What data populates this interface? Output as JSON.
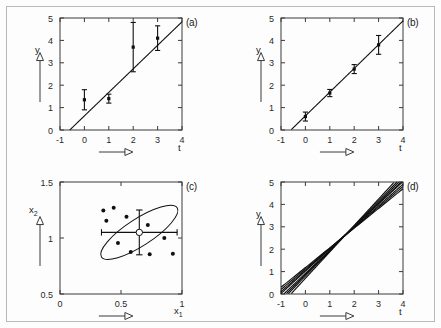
{
  "figure": {
    "panel_labels": [
      "(a)",
      "(b)",
      "(c)",
      "(d)"
    ]
  },
  "chart_data": [
    {
      "panel": "(a)",
      "type": "scatter",
      "title": "",
      "xlabel": "t",
      "ylabel": "y",
      "xlim": [
        -1,
        4
      ],
      "ylim": [
        0,
        5
      ],
      "xticks": [
        -1,
        0,
        1,
        2,
        3,
        4
      ],
      "yticks": [
        0,
        1,
        2,
        3,
        4,
        5
      ],
      "xticklabels": [
        "-1",
        "0",
        "1",
        "2",
        "3",
        "4"
      ],
      "yticklabels": [
        "0",
        "1",
        "2",
        "3",
        "4",
        "5"
      ],
      "grid": false,
      "legend": "none",
      "x": [
        0,
        1,
        2,
        3
      ],
      "values": [
        1.35,
        1.4,
        3.7,
        4.1
      ],
      "yerr": [
        0.45,
        0.2,
        1.1,
        0.55
      ],
      "fit_line": {
        "slope": 1.05,
        "intercept": 0.63,
        "x_start": -0.6,
        "x_end": 4.0
      }
    },
    {
      "panel": "(b)",
      "type": "scatter",
      "title": "",
      "xlabel": "t",
      "ylabel": "y",
      "xlim": [
        -1,
        4
      ],
      "ylim": [
        0,
        5
      ],
      "xticks": [
        -1,
        0,
        1,
        2,
        3,
        4
      ],
      "yticks": [
        0,
        1,
        2,
        3,
        4,
        5
      ],
      "xticklabels": [
        "-1",
        "0",
        "1",
        "2",
        "3",
        "4"
      ],
      "yticklabels": [
        "0",
        "1",
        "2",
        "3",
        "4",
        "5"
      ],
      "grid": false,
      "legend": "none",
      "x": [
        0,
        1,
        2,
        3
      ],
      "values": [
        0.6,
        1.65,
        2.72,
        3.8
      ],
      "yerr": [
        0.2,
        0.16,
        0.2,
        0.42
      ],
      "fit_line": {
        "slope": 1.06,
        "intercept": 0.63,
        "x_start": -0.6,
        "x_end": 4.0
      }
    },
    {
      "panel": "(c)",
      "type": "scatter",
      "title": "",
      "xlabel": "x_1",
      "ylabel": "x_2",
      "xlim": [
        0,
        1
      ],
      "ylim": [
        0.5,
        1.5
      ],
      "xticks": [
        0,
        0.5,
        1
      ],
      "yticks": [
        0.5,
        1,
        1.5
      ],
      "xticklabels": [
        "0",
        "0.5",
        "1"
      ],
      "yticklabels": [
        "0.5",
        "1",
        "1.5"
      ],
      "grid": false,
      "legend": "none",
      "center": [
        0.65,
        1.05
      ],
      "xerr": 0.31,
      "yerr": 0.2,
      "ellipse": {
        "cx": 0.65,
        "cy": 1.05,
        "semi_major": 0.37,
        "semi_minor": 0.12,
        "angle_deg": -33
      },
      "ellipse_points": [
        [
          0.355,
          1.245
        ],
        [
          0.44,
          1.27
        ],
        [
          0.38,
          1.155
        ],
        [
          0.545,
          1.19
        ],
        [
          0.72,
          1.115
        ],
        [
          0.475,
          0.955
        ],
        [
          0.855,
          1.0
        ],
        [
          0.58,
          0.875
        ],
        [
          0.735,
          0.855
        ],
        [
          0.925,
          0.86
        ]
      ]
    },
    {
      "panel": "(d)",
      "type": "line",
      "title": "",
      "xlabel": "t",
      "ylabel": "y",
      "xlim": [
        -1,
        4
      ],
      "ylim": [
        0,
        5
      ],
      "xticks": [
        -1,
        0,
        1,
        2,
        3,
        4
      ],
      "yticks": [
        0,
        1,
        2,
        3,
        4,
        5
      ],
      "xticklabels": [
        "-1",
        "0",
        "1",
        "2",
        "3",
        "4"
      ],
      "yticklabels": [
        "0",
        "1",
        "2",
        "3",
        "4",
        "5"
      ],
      "grid": false,
      "legend": "none",
      "series": [
        {
          "name": "line-1",
          "slope": 1.0,
          "intercept": 1.02
        },
        {
          "name": "line-2",
          "slope": 1.04,
          "intercept": 0.92
        },
        {
          "name": "line-3",
          "slope": 0.92,
          "intercept": 1.12
        },
        {
          "name": "line-4",
          "slope": 1.12,
          "intercept": 0.8
        },
        {
          "name": "line-5",
          "slope": 0.88,
          "intercept": 1.18
        },
        {
          "name": "line-6",
          "slope": 1.18,
          "intercept": 0.7
        },
        {
          "name": "line-7",
          "slope": 0.96,
          "intercept": 1.06
        },
        {
          "name": "line-8",
          "slope": 1.08,
          "intercept": 0.86
        }
      ]
    }
  ]
}
